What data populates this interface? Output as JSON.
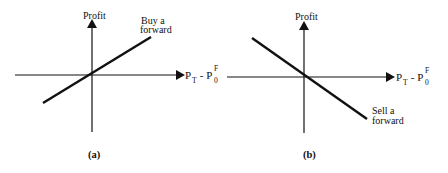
{
  "colors": {
    "ink": "#111111",
    "background": "#ffffff"
  },
  "panels": [
    {
      "id": "a",
      "caption": "(a)",
      "y_axis_label": "Profit",
      "x_axis_label": {
        "main_1": "P",
        "sub_1": "T",
        "mid": " - P",
        "sub_2": "0",
        "sup_2": "F"
      },
      "line_label_1": "Buy a",
      "line_label_2": "forward",
      "slope": "positive"
    },
    {
      "id": "b",
      "caption": "(b)",
      "y_axis_label": "Profit",
      "x_axis_label": {
        "main_1": "P",
        "sub_1": "T",
        "mid": " - P",
        "sub_2": "0",
        "sup_2": "F"
      },
      "line_label_1": "Sell a",
      "line_label_2": "forward",
      "slope": "negative"
    }
  ]
}
